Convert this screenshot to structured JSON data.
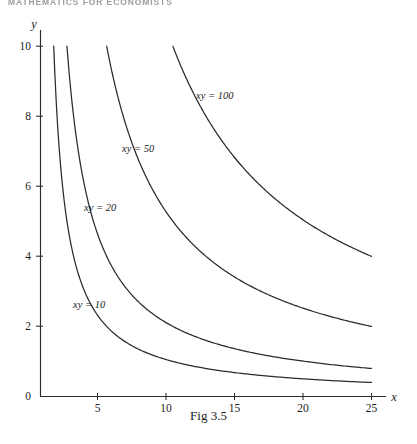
{
  "page": {
    "running_header": "MATHEMATICS FOR ECONOMISTS",
    "caption": "Fig 3.5"
  },
  "axes": {
    "x_name": "x",
    "y_name": "y",
    "x_ticks": [
      "5",
      "10",
      "15",
      "20",
      "25"
    ],
    "y_ticks": [
      "0",
      "2",
      "4",
      "6",
      "8",
      "10"
    ]
  },
  "curve_labels": {
    "c10": "xy = 10",
    "c20": "xy = 20",
    "c50": "xy = 50",
    "c100": "xy = 100"
  },
  "chart_data": {
    "type": "line",
    "title": "Fig 3.5",
    "xlabel": "x",
    "ylabel": "y",
    "xlim": [
      0,
      26.5
    ],
    "ylim": [
      0,
      10.6
    ],
    "grid": false,
    "legend": "inline-curve-labels",
    "x_ticks": [
      5,
      10,
      15,
      20,
      25
    ],
    "y_ticks": [
      0,
      2,
      4,
      6,
      8,
      10
    ],
    "annotations": [
      {
        "text": "xy = 100",
        "x": 14.0,
        "y": 8.4
      },
      {
        "text": "xy = 50",
        "x": 9.0,
        "y": 6.9
      },
      {
        "text": "xy = 20",
        "x": 6.2,
        "y": 5.3
      },
      {
        "text": "xy = 10",
        "x": 4.6,
        "y": 2.6
      }
    ],
    "series": [
      {
        "name": "xy = 10",
        "constant": 10,
        "x": [
          1,
          1.25,
          1.5,
          2,
          2.5,
          3,
          4,
          5,
          6,
          8,
          10,
          12.5,
          15,
          17.5,
          20,
          22.5,
          25
        ],
        "values": [
          10,
          8,
          6.67,
          5,
          4,
          3.33,
          2.5,
          2,
          1.67,
          1.25,
          1,
          0.8,
          0.67,
          0.57,
          0.5,
          0.44,
          0.4
        ]
      },
      {
        "name": "xy = 20",
        "constant": 20,
        "x": [
          2,
          2.5,
          3,
          4,
          5,
          6,
          8,
          10,
          12.5,
          15,
          17.5,
          20,
          22.5,
          25
        ],
        "values": [
          10,
          8,
          6.67,
          5,
          4,
          3.33,
          2.5,
          2,
          1.6,
          1.33,
          1.14,
          1,
          0.89,
          0.8
        ]
      },
      {
        "name": "xy = 50",
        "constant": 50,
        "x": [
          5,
          6,
          7,
          8,
          10,
          12.5,
          15,
          17.5,
          20,
          22.5,
          25
        ],
        "values": [
          10,
          8.33,
          7.14,
          6.25,
          5,
          4,
          3.33,
          2.86,
          2.5,
          2.22,
          2
        ]
      },
      {
        "name": "xy = 100",
        "constant": 100,
        "x": [
          10,
          11,
          12,
          13,
          15,
          17.5,
          20,
          22.5,
          25
        ],
        "values": [
          10,
          9.09,
          8.33,
          7.69,
          6.67,
          5.71,
          5,
          4.44,
          4
        ]
      }
    ]
  }
}
